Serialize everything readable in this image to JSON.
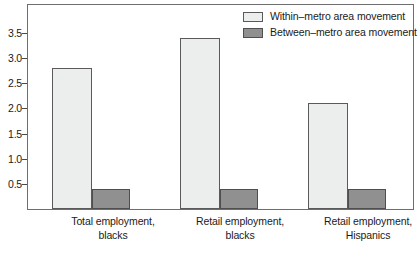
{
  "chart_data": {
    "type": "bar",
    "title": "",
    "subtitle": "",
    "xlabel": "",
    "ylabel": "",
    "ylim": [
      0,
      4.05
    ],
    "yticks": [
      0.5,
      1.0,
      1.5,
      2.0,
      2.5,
      3.0,
      3.5
    ],
    "ytick_labels": [
      "0.5",
      "1.0",
      "1.5",
      "2.0",
      "2.5",
      "3.0",
      "3.5"
    ],
    "grid": false,
    "legend_position": "top-right",
    "categories": [
      "Total employment,\nblacks",
      "Retail employment,\nblacks",
      "Retail employment,\nHispanics"
    ],
    "category_lines": [
      [
        "Total employment,",
        "blacks"
      ],
      [
        "Retail employment,",
        "blacks"
      ],
      [
        "Retail employment,",
        "Hispanics"
      ]
    ],
    "series": [
      {
        "name": "Within–metro area movement",
        "color": "#eceded",
        "edge_color": "#5a5a5a",
        "values": [
          2.8,
          3.4,
          2.1
        ]
      },
      {
        "name": "Between–metro area movement",
        "color": "#909090",
        "edge_color": "#4f4f4f",
        "values": [
          0.4,
          0.4,
          0.4
        ]
      }
    ],
    "annotations": []
  },
  "legend": {
    "items": [
      {
        "label": "Within–metro area movement",
        "swatch": "within"
      },
      {
        "label": "Between–metro area movement",
        "swatch": "between"
      }
    ]
  },
  "colors": {
    "within_fill": "#eceded",
    "between_fill": "#909090",
    "frame": "#6e6e6e",
    "text": "#1a1a1a",
    "background": "#ffffff"
  }
}
